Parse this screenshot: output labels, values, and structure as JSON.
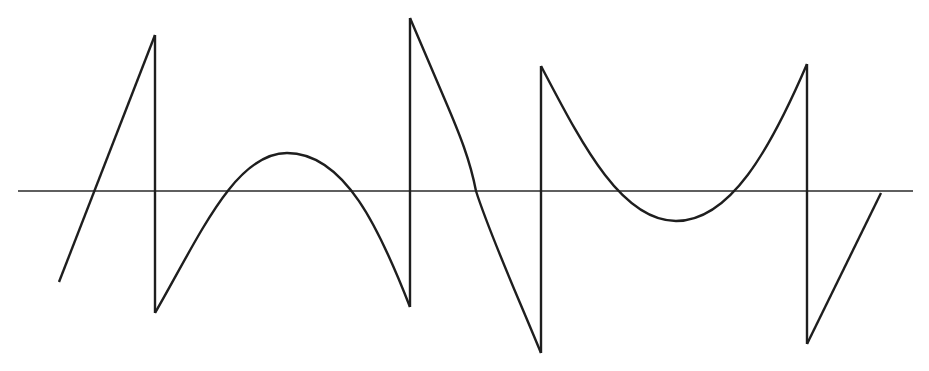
{
  "diagram": {
    "colors": {
      "background": "#ffffff",
      "stroke": "#1e1e1e",
      "axis": "#2a2a2a"
    },
    "axis": {
      "y": 191,
      "x_start": 18,
      "x_end": 913
    },
    "segments": [
      {
        "name": "linear-rise-1",
        "type": "line",
        "from": [
          59,
          282
        ],
        "to": [
          155,
          35
        ]
      },
      {
        "name": "jump-down-1",
        "type": "vertical",
        "x": 155,
        "from_y": 35,
        "to_y": 313
      },
      {
        "name": "arch-up",
        "type": "curve",
        "from": [
          155,
          313
        ],
        "peak": [
          287,
          153
        ],
        "to": [
          410,
          307
        ]
      },
      {
        "name": "jump-up-2",
        "type": "vertical",
        "x": 410,
        "from_y": 307,
        "to_y": 18
      },
      {
        "name": "linear-fall",
        "type": "line",
        "from": [
          410,
          18
        ],
        "to": [
          541,
          353
        ]
      },
      {
        "name": "jump-up-3",
        "type": "vertical",
        "x": 541,
        "from_y": 353,
        "to_y": 66
      },
      {
        "name": "bowl-down",
        "type": "curve",
        "from": [
          541,
          66
        ],
        "trough": [
          676,
          221
        ],
        "to": [
          807,
          64
        ]
      },
      {
        "name": "jump-down-4",
        "type": "vertical",
        "x": 807,
        "from_y": 64,
        "to_y": 344
      },
      {
        "name": "linear-rise-2",
        "type": "line",
        "from": [
          807,
          344
        ],
        "to": [
          881,
          193
        ]
      }
    ]
  }
}
